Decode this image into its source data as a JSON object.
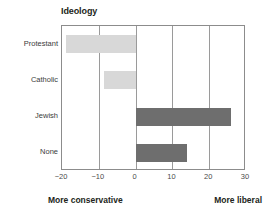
{
  "chart_data": {
    "type": "bar",
    "orientation": "horizontal",
    "title": "Ideology",
    "xlabel": "",
    "ylabel": "",
    "categories": [
      "Protestant",
      "Catholic",
      "Jewish",
      "None"
    ],
    "values": [
      -19,
      -8.5,
      26,
      14
    ],
    "xlim": [
      -20,
      30
    ],
    "xticks": [
      -20,
      -10,
      0,
      10,
      20,
      30
    ],
    "xtick_labels": [
      "−20",
      "−10",
      "0",
      "10",
      "20",
      "30"
    ],
    "grid": true,
    "gridlines_at": [
      -10,
      0,
      10,
      20
    ],
    "legend": "none",
    "annotations": {
      "left": "More conservative",
      "right": "More liberal"
    },
    "bar_colors": {
      "negative": "#d8d8d8",
      "positive": "#6e6e6e"
    },
    "series": [
      {
        "name": "Ideology score",
        "points": [
          {
            "category": "Protestant",
            "value": -19
          },
          {
            "category": "Catholic",
            "value": -8.5
          },
          {
            "category": "Jewish",
            "value": 26
          },
          {
            "category": "None",
            "value": 14
          }
        ]
      }
    ]
  },
  "frame": {
    "border_color": "#8c8c8c",
    "gridline_color": "#9a9a9a",
    "background": "#ffffff"
  }
}
